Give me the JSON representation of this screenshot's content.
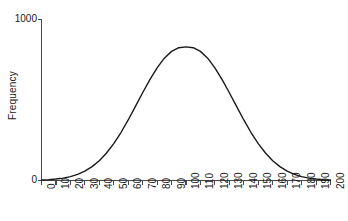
{
  "chart_data": {
    "type": "line",
    "title": "",
    "subtitle": "",
    "xlabel": "",
    "ylabel": "Frequency",
    "xlim": [
      0,
      200
    ],
    "ylim": [
      0,
      1000
    ],
    "grid": false,
    "legend": false,
    "legend_position": "none",
    "xticks": [
      0,
      10,
      20,
      30,
      40,
      50,
      60,
      70,
      80,
      90,
      100,
      110,
      120,
      130,
      140,
      150,
      160,
      170,
      180,
      190,
      200
    ],
    "xtick_labels": [
      "0",
      "10",
      "20",
      "30",
      "40",
      "50",
      "60",
      "70",
      "80",
      "90",
      "100",
      "110",
      "120",
      "130",
      "140",
      "150",
      "160",
      "170",
      "180",
      "190",
      "200"
    ],
    "xtick_rotation": -90,
    "yticks": [
      0,
      1000
    ],
    "ytick_labels": [
      "0",
      "1000"
    ],
    "line_color": "#1a1a1a",
    "line_width": 1.4,
    "series": [
      {
        "name": "Frequency distribution",
        "shape": "normal-bell-curve",
        "mean": 100,
        "sigma": 35,
        "peak": 830,
        "x": [
          0,
          5,
          10,
          15,
          20,
          25,
          30,
          35,
          40,
          45,
          50,
          55,
          60,
          65,
          70,
          75,
          80,
          85,
          90,
          95,
          100,
          105,
          110,
          115,
          120,
          125,
          130,
          135,
          140,
          145,
          150,
          155,
          160,
          165,
          170,
          175,
          180,
          185,
          190,
          195,
          200
        ],
        "values": [
          3,
          5,
          9,
          15,
          24,
          38,
          58,
          86,
          123,
          171,
          229,
          298,
          376,
          460,
          545,
          627,
          700,
          760,
          802,
          825,
          830,
          825,
          802,
          760,
          700,
          627,
          545,
          460,
          376,
          298,
          229,
          171,
          123,
          86,
          58,
          38,
          24,
          15,
          9,
          5,
          3
        ]
      }
    ]
  }
}
